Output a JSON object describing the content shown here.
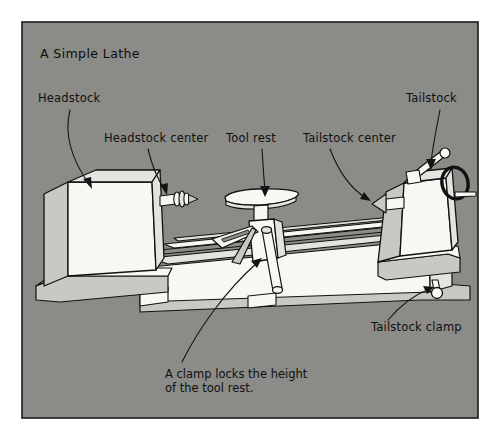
{
  "figure": {
    "title": "A Simple Lathe",
    "panel": {
      "background_color": "#8b8b87",
      "border_color": "#1a1a1a",
      "page_color": "#ffffff",
      "x": 22,
      "y": 22,
      "width": 456,
      "height": 396
    },
    "ink_color": "#111111"
  },
  "labels": [
    {
      "id": "headstock",
      "text": "Headstock",
      "x": 38,
      "y": 102,
      "anchor": "start",
      "target_x": 92,
      "target_y": 188
    },
    {
      "id": "headstock-center",
      "text": "Headstock center",
      "x": 104,
      "y": 142,
      "anchor": "start",
      "target_x": 166,
      "target_y": 194
    },
    {
      "id": "tool-rest",
      "text": "Tool rest",
      "x": 226,
      "y": 142,
      "anchor": "start",
      "target_x": 265,
      "target_y": 196
    },
    {
      "id": "tailstock-center",
      "text": "Tailstock center",
      "x": 303,
      "y": 142,
      "anchor": "start",
      "target_x": 370,
      "target_y": 202
    },
    {
      "id": "tailstock",
      "text": "Tailstock",
      "x": 406,
      "y": 102,
      "anchor": "start",
      "target_x": 432,
      "target_y": 170
    },
    {
      "id": "tailstock-clamp",
      "text": "Tailstock clamp",
      "x": 371,
      "y": 331,
      "anchor": "start",
      "target_x": 437,
      "target_y": 291
    }
  ],
  "note": {
    "id": "tool-rest-note",
    "line1": "A clamp locks the height",
    "line2": "of the tool rest.",
    "x": 165,
    "y": 378,
    "target_x": 262,
    "target_y": 258
  },
  "machine": {
    "parts": [
      "headstock",
      "headstock-center",
      "bed-rails",
      "tool-rest",
      "tool-rest-clamp-lever",
      "tailstock",
      "tailstock-center",
      "tailstock-handwheel",
      "tailstock-lever",
      "tailstock-clamp"
    ]
  }
}
